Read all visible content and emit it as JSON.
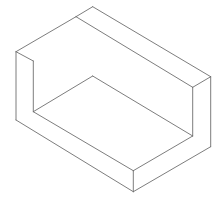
{
  "diagram": {
    "type": "isometric-line-drawing",
    "line_color": "#6e6e6e",
    "background": "#ffffff",
    "vertices": {
      "top_back": [
        92.7,
        6.7
      ],
      "top_notch": [
        76,
        16.7
      ],
      "left_top": [
        16,
        51.7
      ],
      "left_inner_top": [
        33.3,
        61
      ],
      "left_bottom": [
        16,
        120
      ],
      "left_inner_bottom": [
        33.3,
        111.7
      ],
      "floor_back": [
        92.7,
        76
      ],
      "right_top": [
        210.7,
        76.7
      ],
      "right_inner_top": [
        192.7,
        87.3
      ],
      "right_inner_bottom": [
        192.7,
        136
      ],
      "right_bottom": [
        210.7,
        146.7
      ],
      "front_top": [
        133.3,
        170.7
      ],
      "front_bottom": [
        133.3,
        191.7
      ]
    }
  }
}
